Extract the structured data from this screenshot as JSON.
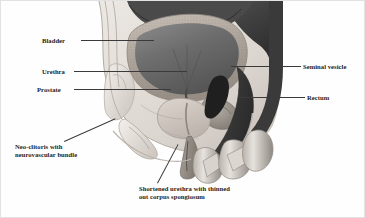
{
  "figure": {
    "kind": "medical-illustration",
    "view": "sagittal cross-section of male pelvis (post vaginoplasty anatomy)",
    "background_color": "#fefefe",
    "border_color": "#e2e2e2",
    "label_color": "#1d1d1d",
    "leader_color": "#3a3a3a"
  },
  "labels": {
    "bladder": "Bladder",
    "urethra": "Urethra",
    "prostate": "Prostate",
    "seminal_vesicle": "Seminal vesicle",
    "rectum": "Rectum",
    "neoclitoris_line1": "Neo-clitoris with",
    "neoclitoris_line2": "neurovascular bundle",
    "shortened_urethra_line1": "Shortened urethra with thinned",
    "shortened_urethra_line2": "out corpus spongiosum"
  },
  "anatomy_parts": [
    {
      "name": "bladder",
      "tone": "#6e6e6e",
      "wall_tone": "#b4aca4"
    },
    {
      "name": "prostate",
      "tone": "#cfc7bf"
    },
    {
      "name": "seminal-vesicle",
      "tone": "#9a958f"
    },
    {
      "name": "rectum",
      "tone": "#4a4a4a"
    },
    {
      "name": "pubic-bone",
      "tone": "#dedad4"
    },
    {
      "name": "sacrum",
      "tone": "#3c3c3c"
    },
    {
      "name": "neo-clitoris",
      "tone": "#c6bfb8"
    },
    {
      "name": "shortened-urethra",
      "tone": "#8d8680"
    },
    {
      "name": "corpus-spongiosum",
      "tone": "#a39c95"
    }
  ]
}
